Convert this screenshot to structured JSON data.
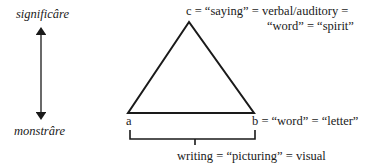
{
  "diagram": {
    "axis": {
      "top_label": "significâre",
      "bottom_label": "monstrâre"
    },
    "vertices": {
      "c": {
        "label": "c = “saying” = verbal/auditory =",
        "label_line2": "“word” = “spirit”"
      },
      "a": {
        "label": "a"
      },
      "b": {
        "label": "b = “word” = “letter”"
      }
    },
    "bracket": {
      "label": "writing = “picturing” = visual"
    },
    "colors": {
      "stroke": "#1a1a1a",
      "background": "#ffffff"
    }
  }
}
